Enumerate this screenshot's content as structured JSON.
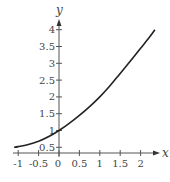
{
  "chart_data": {
    "type": "line",
    "title": "",
    "xlabel": "x",
    "ylabel": "y",
    "xlim": [
      -1.15,
      2.45
    ],
    "ylim": [
      0.32,
      4.3
    ],
    "x_ticks": [
      -1,
      -0.5,
      0,
      0.5,
      1,
      1.5,
      2
    ],
    "x_tick_labels": [
      "-1",
      "-0.5",
      "0",
      "0.5",
      "1",
      "1.5",
      "2"
    ],
    "y_ticks": [
      0.5,
      1,
      1.5,
      2,
      2.5,
      3,
      3.5,
      4
    ],
    "y_tick_labels": [
      "0.5",
      "1",
      "1.5",
      "2",
      "2.5",
      "3",
      "3.5",
      "4"
    ],
    "grid": false,
    "legend": null,
    "series": [
      {
        "name": "curve",
        "x": [
          -1.1,
          -1,
          -0.75,
          -0.5,
          -0.25,
          0,
          0.25,
          0.5,
          0.75,
          1,
          1.25,
          1.5,
          1.75,
          2,
          2.2,
          2.35
        ],
        "y": [
          0.5,
          0.52,
          0.58,
          0.68,
          0.82,
          1.0,
          1.21,
          1.45,
          1.71,
          2.0,
          2.33,
          2.7,
          3.07,
          3.45,
          3.75,
          4.0
        ]
      }
    ]
  },
  "axes": {
    "x_label": "x",
    "y_label": "y"
  }
}
